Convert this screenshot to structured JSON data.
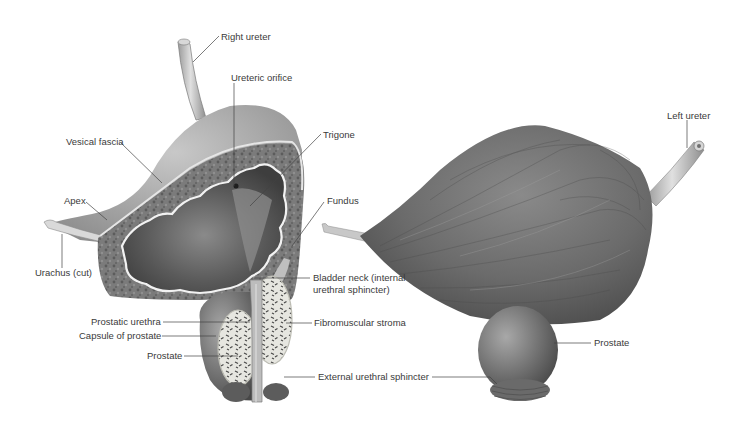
{
  "figure": {
    "colors": {
      "background": "#ffffff",
      "label_text": "#3a3a3a",
      "leader_line": "#444444",
      "muscle_dark": "#555555",
      "muscle_mid": "#7a7a7a",
      "fascia_light": "#bdbdbd",
      "mucosa_highlight": "#e8e8e8"
    },
    "left_view": {
      "name": "Sagittal section of bladder",
      "labels": {
        "right_ureter": "Right ureter",
        "ureteric_orifice": "Ureteric orifice",
        "vesical_fascia": "Vesical fascia",
        "trigone": "Trigone",
        "apex": "Apex",
        "fundus": "Fundus",
        "urachus": "Urachus (cut)",
        "bladder_neck": "Bladder neck (internal urethral sphincter)",
        "prostatic_urethra": "Prostatic urethra",
        "fibromuscular_stroma": "Fibromuscular stroma",
        "capsule_of_prostate": "Capsule of prostate",
        "prostate": "Prostate",
        "external_urethral_sphincter": "External urethral sphincter"
      }
    },
    "right_view": {
      "name": "External view of bladder",
      "labels": {
        "left_ureter": "Left ureter",
        "prostate": "Prostate"
      }
    }
  }
}
